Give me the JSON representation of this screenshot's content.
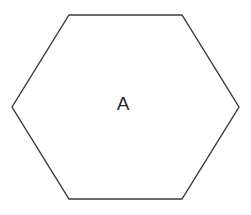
{
  "canvas": {
    "width": 251,
    "height": 215,
    "background_color": "#ffffff"
  },
  "diagram": {
    "shape_type": "hexagon",
    "sides": 6,
    "stroke_color": "#3a3a3c",
    "stroke_width": 1.4,
    "fill_color": "#ffffff",
    "points": "12,107 69,15 182,15 239,107 182,199 69,199",
    "vertices": [
      {
        "name": "left",
        "x": 12,
        "y": 107
      },
      {
        "name": "top-left",
        "x": 69,
        "y": 15
      },
      {
        "name": "top-right",
        "x": 182,
        "y": 15
      },
      {
        "name": "right",
        "x": 239,
        "y": 107
      },
      {
        "name": "bottom-right",
        "x": 182,
        "y": 199
      },
      {
        "name": "bottom-left",
        "x": 69,
        "y": 199
      }
    ],
    "label": {
      "text": "A",
      "x": 123,
      "y": 105,
      "font_size": 19,
      "color": "#27272a"
    }
  }
}
